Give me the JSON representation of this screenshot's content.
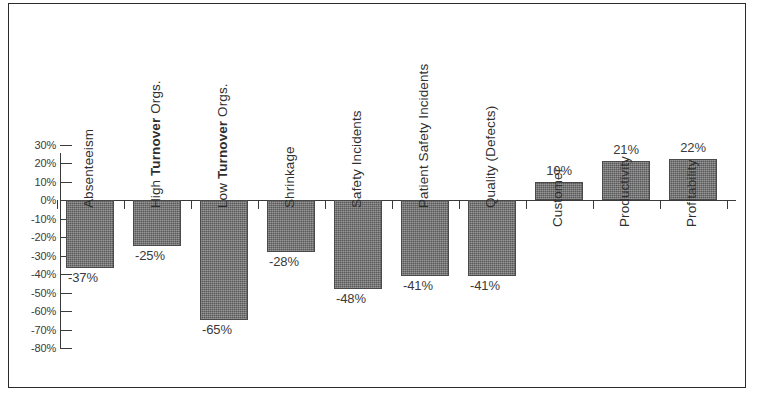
{
  "chart_data": {
    "type": "bar",
    "title": "",
    "subtitle": "",
    "xlabel": "",
    "ylabel": "",
    "ylim": [
      -80,
      30
    ],
    "grid": false,
    "legend": false,
    "legend_position": "none",
    "orientation": "vertical",
    "zero_line": true,
    "ytick_labels": [
      "30%",
      "20%",
      "10%",
      "0%",
      "-10%",
      "-20%",
      "-30%",
      "-40%",
      "-50%",
      "-60%",
      "-70%",
      "-80%"
    ],
    "ytick_values": [
      30,
      20,
      10,
      0,
      -10,
      -20,
      -30,
      -40,
      -50,
      -60,
      -70,
      -80
    ],
    "categories": [
      "Absenteeism",
      "High Turnover Orgs.",
      "Low Turnover Orgs.",
      "Shrinkage",
      "Safety Incidents",
      "Patient Safety Incidents",
      "Quality (Defects)",
      "Customer",
      "Productivity",
      "Profitability"
    ],
    "category_parts": [
      [
        {
          "text": "Absenteeism",
          "bold": false
        }
      ],
      [
        {
          "text": "High ",
          "bold": false
        },
        {
          "text": "Turnover",
          "bold": true
        },
        {
          "text": " Orgs.",
          "bold": false
        }
      ],
      [
        {
          "text": "Low ",
          "bold": false
        },
        {
          "text": "Turnover",
          "bold": true
        },
        {
          "text": " Orgs.",
          "bold": false
        }
      ],
      [
        {
          "text": "Shrinkage",
          "bold": false
        }
      ],
      [
        {
          "text": "Safety Incidents",
          "bold": false
        }
      ],
      [
        {
          "text": "Patient Safety Incidents",
          "bold": false
        }
      ],
      [
        {
          "text": "Quality (Defects)",
          "bold": false
        }
      ],
      [
        {
          "text": "Customer",
          "bold": false
        }
      ],
      [
        {
          "text": "Productivity",
          "bold": false
        }
      ],
      [
        {
          "text": "Profitability",
          "bold": false
        }
      ]
    ],
    "values": [
      -37,
      -25,
      -65,
      -28,
      -48,
      -41,
      -41,
      10,
      21,
      22
    ],
    "value_labels": [
      "-37%",
      "-25%",
      "-65%",
      "-28%",
      "-48%",
      "-41%",
      "-41%",
      "10%",
      "21%",
      "22%"
    ],
    "bar_color": "#6e6e6e",
    "bar_border_color": "#4a4a4a",
    "axis_color": "#3a3a3a",
    "frame_color": "#2b2b2b",
    "background_color": "#ffffff"
  }
}
